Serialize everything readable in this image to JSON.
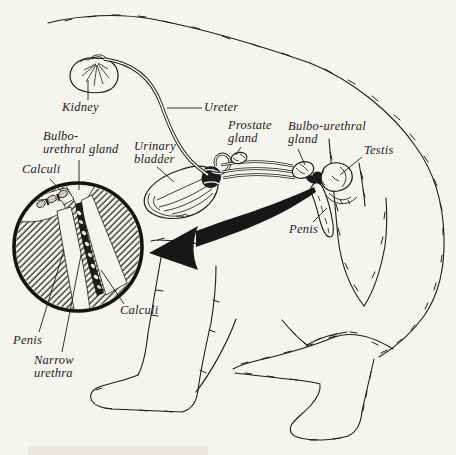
{
  "colors": {
    "ink": "#1c1c1c",
    "paper": "#f6f4ef"
  },
  "labels": {
    "kidney": "Kidney",
    "ureter": "Ureter",
    "bulbo_urethral_left": "Bulbo-\nurethral gland",
    "calculi_top": "Calculi",
    "urinary_bladder": "Urinary\nbladder",
    "prostate": "Prostate\ngland",
    "bulbo_urethral_right": "Bulbo-urethral\ngland",
    "testis": "Testis",
    "penis": "Penis",
    "calculi_inset": "Calculi",
    "penis_inset": "Penis",
    "narrow_urethra": "Narrow\nurethra"
  }
}
